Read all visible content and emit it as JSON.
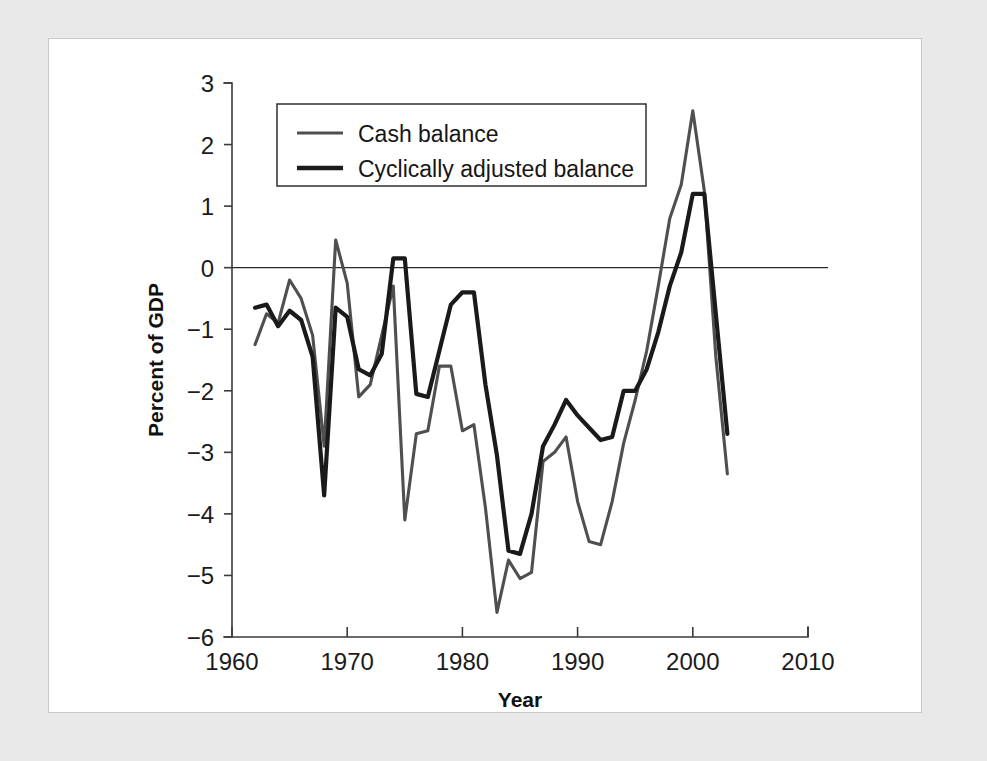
{
  "figure": {
    "frame_color": "#e9e9e9",
    "plot_background": "#ffffff"
  },
  "chart_data": {
    "type": "line",
    "title": "",
    "subtitle": "",
    "xlabel": "Year",
    "ylabel": "Percent of GDP",
    "xlim": [
      1960,
      2010
    ],
    "ylim": [
      -6,
      3
    ],
    "grid": false,
    "legend_position": "upper-left-inside",
    "zero_line": 0,
    "xticks": [
      "1960",
      "1970",
      "1980",
      "1990",
      "2000",
      "2010"
    ],
    "xtick_values": [
      1960,
      1970,
      1980,
      1990,
      2000,
      2010
    ],
    "yticks": [
      "3",
      "2",
      "1",
      "0",
      "−1",
      "−2",
      "−3",
      "−4",
      "−5",
      "−6"
    ],
    "ytick_values": [
      3,
      2,
      1,
      0,
      -1,
      -2,
      -3,
      -4,
      -5,
      -6
    ],
    "x": [
      1962,
      1963,
      1964,
      1965,
      1966,
      1967,
      1968,
      1969,
      1970,
      1971,
      1972,
      1973,
      1974,
      1975,
      1976,
      1977,
      1978,
      1979,
      1980,
      1981,
      1982,
      1983,
      1984,
      1985,
      1986,
      1987,
      1988,
      1989,
      1990,
      1991,
      1992,
      1993,
      1994,
      1995,
      1996,
      1997,
      1998,
      1999,
      2000,
      2001,
      2002,
      2003
    ],
    "series": [
      {
        "name": "Cash balance",
        "color": "#4f4f4f",
        "linewidth": 3.1,
        "values": [
          -1.25,
          -0.75,
          -0.9,
          -0.2,
          -0.5,
          -1.1,
          -2.9,
          0.45,
          -0.25,
          -2.1,
          -1.9,
          -1.1,
          -0.3,
          -4.1,
          -2.7,
          -2.65,
          -1.6,
          -1.6,
          -2.65,
          -2.55,
          -3.9,
          -5.6,
          -4.75,
          -5.05,
          -4.95,
          -3.15,
          -3.0,
          -2.75,
          -3.8,
          -4.45,
          -4.5,
          -3.8,
          -2.85,
          -2.15,
          -1.35,
          -0.3,
          0.8,
          1.35,
          2.55,
          1.25,
          -1.45,
          -3.35
        ]
      },
      {
        "name": "Cyclically adjusted balance",
        "color": "#1a1a1a",
        "linewidth": 4.2,
        "values": [
          -0.65,
          -0.6,
          -0.95,
          -0.7,
          -0.85,
          -1.45,
          -3.7,
          -0.65,
          -0.8,
          -1.65,
          -1.75,
          -1.4,
          0.15,
          0.15,
          -2.05,
          -2.1,
          -1.35,
          -0.6,
          -0.4,
          -0.4,
          -1.9,
          -3.05,
          -4.6,
          -4.65,
          -4.0,
          -2.9,
          -2.55,
          -2.15,
          -2.4,
          -2.6,
          -2.8,
          -2.75,
          -2.0,
          -2.0,
          -1.65,
          -1.05,
          -0.3,
          0.25,
          1.2,
          1.2,
          -0.75,
          -2.7
        ]
      }
    ]
  },
  "legend": {
    "entries": [
      {
        "label": "Cash balance",
        "swatch": "line-swatch-thin"
      },
      {
        "label": "Cyclically adjusted balance",
        "swatch": "line-swatch-thick"
      }
    ]
  }
}
